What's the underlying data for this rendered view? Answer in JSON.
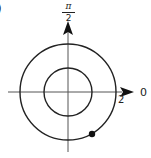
{
  "diagram": {
    "type": "polar-graph",
    "corner_label": ")",
    "axis_labels": {
      "top": {
        "numerator": "π",
        "denominator": "2"
      },
      "right": "0"
    },
    "radius_tick_label": "2",
    "circles": [
      {
        "name": "outer",
        "radius": 2
      },
      {
        "name": "inner",
        "radius": 1
      }
    ],
    "point": {
      "description": "filled dot on outer circle, lower-right quadrant"
    },
    "colors": {
      "stroke": "#222222",
      "background": "#ffffff"
    }
  }
}
